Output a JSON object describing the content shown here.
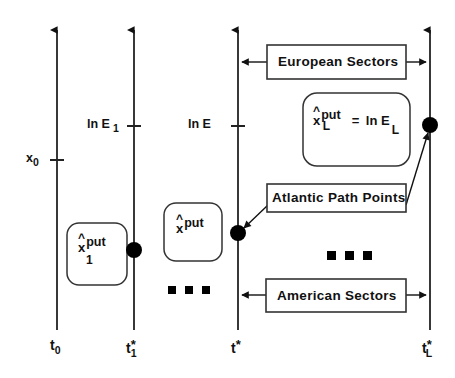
{
  "figure": {
    "background": "#ffffff",
    "line_color": "#222222"
  },
  "axes": [
    {
      "id": "axis-t0",
      "x": 57,
      "time_label": "t",
      "time_sub": "0",
      "time_star": "",
      "value_label": "",
      "value_sub": "",
      "tick_y": 160
    },
    {
      "id": "axis-t1star",
      "x": 134,
      "time_label": "t",
      "time_sub": "1",
      "time_star": "*",
      "value_label": "ln E",
      "value_sub": "1",
      "tick_y": 126
    },
    {
      "id": "axis-tstar",
      "x": 238,
      "time_label": "t",
      "time_sub": "",
      "time_star": "*",
      "value_label": "ln E",
      "value_sub": "",
      "tick_y": 126
    },
    {
      "id": "axis-tLstar",
      "x": 430,
      "time_label": "t",
      "time_sub": "L",
      "time_star": "*",
      "value_label": "",
      "value_sub": "",
      "tick_y": 0
    }
  ],
  "axis_value_labels": {
    "x0": {
      "base": "x",
      "sub": "0"
    },
    "lnE1": {
      "base": "ln E",
      "sub": "1"
    },
    "lnE": {
      "base": "ln E",
      "sub": ""
    }
  },
  "callouts": {
    "european_sectors": "European Sectors",
    "american_sectors": "American Sectors",
    "atlantic_path_points": "Atlantic Path Points"
  },
  "exercise_boxes": [
    {
      "id": "box-x1-put",
      "var": "x",
      "hat": "^",
      "sup": "put",
      "sub": "1",
      "equals": "",
      "rhs": "",
      "rhs_sub": ""
    },
    {
      "id": "box-x-put",
      "var": "x",
      "hat": "^",
      "sup": "put",
      "sub": "",
      "equals": "",
      "rhs": "",
      "rhs_sub": ""
    },
    {
      "id": "box-xL-put",
      "var": "x",
      "hat": "^",
      "sup": "put",
      "sub": "L",
      "equals": "=",
      "rhs": "ln E",
      "rhs_sub": "L"
    }
  ],
  "ellipses": [
    {
      "id": "ellipsis-mid-left",
      "dots": 3
    },
    {
      "id": "ellipsis-mid-right",
      "dots": 3
    }
  ],
  "path_point_markers": [
    {
      "id": "dot-axis-t1star",
      "x": 134,
      "y": 250
    },
    {
      "id": "dot-axis-tstar",
      "x": 238,
      "y": 233
    },
    {
      "id": "dot-axis-tLstar",
      "x": 430,
      "y": 125
    }
  ]
}
